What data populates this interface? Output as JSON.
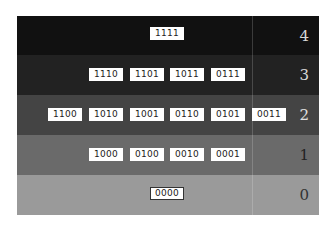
{
  "diagram": {
    "type": "boolean-lattice-by-rank",
    "rows": [
      {
        "rank": "4",
        "color": "#111111",
        "rank_color": "#d8d8d8",
        "top": 0,
        "height": 39,
        "boxes": [
          {
            "label": "1111",
            "x": 133,
            "y": 11
          }
        ]
      },
      {
        "rank": "3",
        "color": "#222222",
        "rank_color": "#d8d8d8",
        "top": 39,
        "height": 40,
        "boxes": [
          {
            "label": "1110",
            "x": 72,
            "y": 13
          },
          {
            "label": "1101",
            "x": 113,
            "y": 13
          },
          {
            "label": "1011",
            "x": 153,
            "y": 13
          },
          {
            "label": "0111",
            "x": 194,
            "y": 13
          }
        ]
      },
      {
        "rank": "2",
        "color": "#444444",
        "rank_color": "#e0e0e0",
        "top": 79,
        "height": 40,
        "boxes": [
          {
            "label": "1100",
            "x": 31,
            "y": 13
          },
          {
            "label": "1010",
            "x": 72,
            "y": 13
          },
          {
            "label": "1001",
            "x": 113,
            "y": 13
          },
          {
            "label": "0110",
            "x": 153,
            "y": 13
          },
          {
            "label": "0101",
            "x": 194,
            "y": 13
          },
          {
            "label": "0011",
            "x": 235,
            "y": 13
          }
        ]
      },
      {
        "rank": "1",
        "color": "#6a6a6a",
        "rank_color": "#222222",
        "top": 119,
        "height": 40,
        "boxes": [
          {
            "label": "1000",
            "x": 72,
            "y": 13
          },
          {
            "label": "0100",
            "x": 113,
            "y": 13
          },
          {
            "label": "0010",
            "x": 153,
            "y": 13
          },
          {
            "label": "0001",
            "x": 194,
            "y": 13
          }
        ]
      },
      {
        "rank": "0",
        "color": "#9a9a9a",
        "rank_color": "#333333",
        "top": 159,
        "height": 40,
        "boxes": [
          {
            "label": "0000",
            "x": 133,
            "y": 12,
            "bordered": true
          }
        ]
      }
    ]
  }
}
